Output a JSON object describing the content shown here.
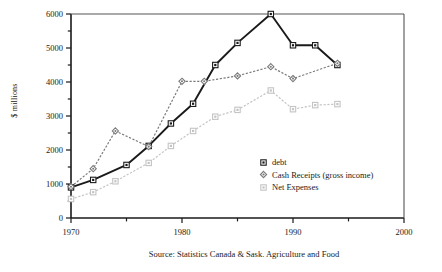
{
  "chart_data": {
    "type": "line",
    "title": "",
    "xlabel": "",
    "ylabel": "$ millions",
    "xlim": [
      1970,
      2000
    ],
    "ylim": [
      0,
      6000
    ],
    "xticks": [
      1970,
      1975,
      1980,
      1985,
      1990,
      1995,
      2000
    ],
    "xtick_labels": [
      "1970",
      "",
      "1980",
      "",
      "1990",
      "",
      "2000"
    ],
    "yticks": [
      0,
      500,
      1000,
      1500,
      2000,
      2500,
      3000,
      3500,
      4000,
      4500,
      5000,
      5500,
      6000
    ],
    "ytick_labels": [
      "0",
      "",
      "1000",
      "",
      "2000",
      "",
      "3000",
      "",
      "4000",
      "",
      "5000",
      "",
      "6000"
    ],
    "grid": false,
    "legend_position": "inside-right",
    "source_note": "Source: Statistics Canada & Sask. Agriculture and Food",
    "series": [
      {
        "name": "debt",
        "color": "#1a1a1a",
        "marker": "square",
        "linestyle": "solid",
        "x": [
          1970,
          1972,
          1975,
          1977,
          1979,
          1981,
          1983,
          1985,
          1988,
          1990,
          1992,
          1994
        ],
        "values": [
          900,
          1120,
          1560,
          2120,
          2780,
          3360,
          4500,
          5150,
          6000,
          5080,
          5080,
          4500
        ]
      },
      {
        "name": "Cash Receipts (gross income)",
        "color": "#7a7a7a",
        "marker": "diamond",
        "linestyle": "dotted",
        "x": [
          1970,
          1972,
          1974,
          1977,
          1980,
          1982,
          1985,
          1988,
          1990,
          1994
        ],
        "values": [
          920,
          1450,
          2560,
          2100,
          4020,
          4020,
          4180,
          4450,
          4100,
          4550
        ]
      },
      {
        "name": "Net Expenses",
        "color": "#c4c4c4",
        "marker": "square",
        "linestyle": "dotted",
        "x": [
          1970,
          1972,
          1974,
          1977,
          1979,
          1981,
          1983,
          1985,
          1988,
          1990,
          1992,
          1994
        ],
        "values": [
          560,
          760,
          1080,
          1620,
          2120,
          2560,
          2980,
          3180,
          3750,
          3200,
          3320,
          3350
        ]
      }
    ]
  },
  "legend": {
    "items": [
      {
        "label": "debt"
      },
      {
        "label": "Cash Receipts (gross income)"
      },
      {
        "label": "Net Expenses"
      }
    ]
  },
  "axis": {
    "y_title": "$ millions"
  },
  "footer": {
    "source": "Source: Statistics Canada & Sask. Agriculture and Food"
  }
}
